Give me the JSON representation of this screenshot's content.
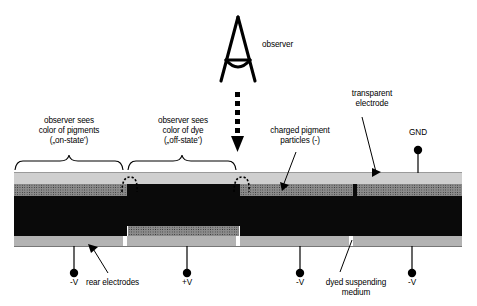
{
  "diagram": {
    "observer": {
      "label": "observer",
      "icon": "eye-observer-icon",
      "ray_icon": "dotted-down-arrow-icon"
    },
    "brace_labels": [
      {
        "id": "on-state",
        "text": "observer sees\ncolor of pigments\n(„on-state’)"
      },
      {
        "id": "off-state",
        "text": "observer sees\ncolor of dye\n(„off-state’)"
      }
    ],
    "callouts": [
      {
        "id": "charged-pigment-particles",
        "text": "charged pigment\nparticles (-)"
      },
      {
        "id": "transparent-electrode",
        "text": "transparent\nelectrode"
      },
      {
        "id": "ground",
        "text": "GND"
      },
      {
        "id": "rear-electrodes",
        "text": "rear electrodes"
      },
      {
        "id": "dyed-suspending-medium",
        "text": "dyed suspending\nmedium"
      }
    ],
    "terminals": [
      {
        "id": "terminal-1",
        "label": "-V",
        "x": 74
      },
      {
        "id": "terminal-2",
        "label": "+V",
        "x": 187
      },
      {
        "id": "terminal-3",
        "label": "-V",
        "x": 300
      },
      {
        "id": "terminal-4",
        "label": "-V",
        "x": 412
      }
    ],
    "layers": [
      {
        "id": "transparent-electrode-layer",
        "name": "transparent electrode",
        "color": "#cccccc"
      },
      {
        "id": "pigment-layer",
        "name": "charged pigment particles",
        "color": "#8a8a8a"
      },
      {
        "id": "dye-layer",
        "name": "dyed suspending medium",
        "color": "#0a0a0a"
      },
      {
        "id": "rear-electrode-layer",
        "name": "rear electrodes",
        "color": "#b0b0b0"
      }
    ],
    "cells": [
      {
        "id": "cell-1",
        "state": "on-state",
        "pigment_position": "top"
      },
      {
        "id": "cell-2",
        "state": "off-state",
        "pigment_position": "bottom"
      },
      {
        "id": "cell-3",
        "state": "on-state",
        "pigment_position": "top"
      },
      {
        "id": "cell-4",
        "state": "on-state",
        "pigment_position": "top"
      }
    ]
  }
}
